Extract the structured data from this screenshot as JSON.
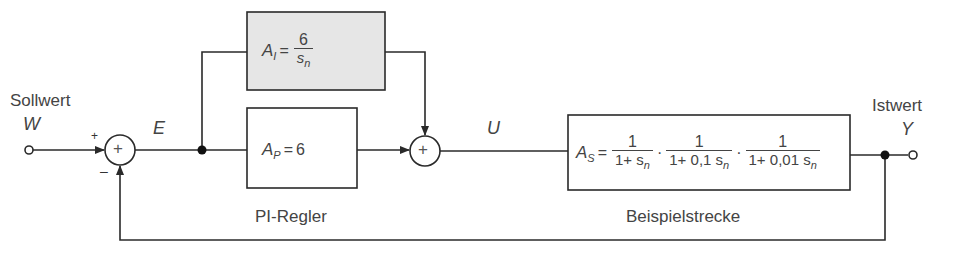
{
  "labels": {
    "setpoint": "Sollwert",
    "setpoint_symbol": "W",
    "error_symbol": "E",
    "control_symbol": "U",
    "actual": "Istwert",
    "actual_symbol": "Y",
    "plus_sign": "+",
    "minus_sign": "–",
    "controller_caption": "PI-Regler",
    "plant_caption": "Beispielstrecke"
  },
  "blocks": {
    "integral": {
      "lhs": "A",
      "lhs_sub": "I",
      "eq": "=",
      "num": "6",
      "den": "s",
      "den_sub": "n",
      "fill": "#e6e6e6"
    },
    "proportional": {
      "lhs": "A",
      "lhs_sub": "P",
      "eq": "=",
      "value": "6"
    },
    "plant": {
      "lhs": "A",
      "lhs_sub": "S",
      "eq": "=",
      "dot": "·",
      "fractions": [
        {
          "num": "1",
          "den": "1+ s",
          "den_sub": "n"
        },
        {
          "num": "1",
          "den": "1+ 0,1 s",
          "den_sub": "n"
        },
        {
          "num": "1",
          "den": "1+ 0,01 s",
          "den_sub": "n"
        }
      ]
    }
  },
  "summers": {
    "glyph": "+"
  },
  "colors": {
    "line": "#2a2a2a",
    "text": "#444444",
    "integral_fill": "#e6e6e6"
  }
}
